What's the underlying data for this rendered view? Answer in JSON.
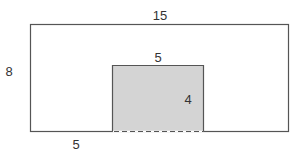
{
  "diagram": {
    "outer_rect": {
      "x": 30,
      "y": 24,
      "width": 258,
      "height": 107,
      "stroke": "#555555",
      "fill": "#ffffff"
    },
    "inner_rect": {
      "x": 112,
      "y": 65,
      "width": 91,
      "height": 66,
      "stroke": "#555555",
      "fill": "#d4d4d4",
      "bottom_edge": "dashed"
    },
    "labels": {
      "outer_width": "15",
      "outer_height": "8",
      "inner_width": "5",
      "inner_height": "4",
      "left_offset": "5"
    },
    "colors": {
      "stroke": "#555555",
      "shaded_fill": "#d4d4d4",
      "text": "#333333"
    }
  }
}
